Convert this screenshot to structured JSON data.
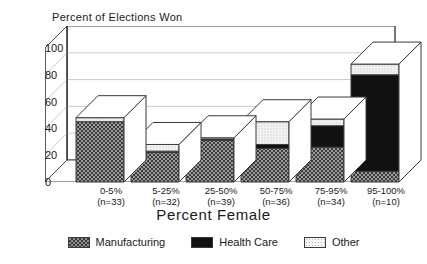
{
  "chart_data": {
    "type": "bar",
    "title": "Percent of Elections Won",
    "xlabel": "Percent Female",
    "ylabel": "",
    "ylim": [
      0,
      100
    ],
    "yticks": [
      0,
      20,
      40,
      60,
      80,
      100
    ],
    "grid": true,
    "stacked": true,
    "three_d": true,
    "legend_position": "bottom",
    "categories": [
      "0-5%",
      "5-25%",
      "25-50%",
      "50-75%",
      "75-95%",
      "95-100%"
    ],
    "category_sublabels": [
      "(n=33)",
      "(n=32)",
      "(n=39)",
      "(n=36)",
      "(n=34)",
      "(n=10)"
    ],
    "series": [
      {
        "name": "Manufacturing",
        "values": [
          45,
          22,
          31,
          25,
          26,
          8
        ]
      },
      {
        "name": "Health Care",
        "values": [
          0,
          1,
          1,
          3,
          16,
          72
        ]
      },
      {
        "name": "Other",
        "values": [
          3,
          5,
          1,
          17,
          5,
          8
        ]
      }
    ],
    "totals": [
      48,
      28,
      33,
      45,
      47,
      88
    ]
  },
  "legend": {
    "items": [
      {
        "label": "Manufacturing",
        "key": "manufacturing",
        "color": "#8e8e8e"
      },
      {
        "label": "Health Care",
        "key": "health",
        "color": "#111111"
      },
      {
        "label": "Other",
        "key": "other",
        "color": "#f2f2f2"
      }
    ]
  },
  "axis": {
    "y_labels": [
      "100",
      "80",
      "60",
      "40",
      "20",
      "0"
    ]
  }
}
